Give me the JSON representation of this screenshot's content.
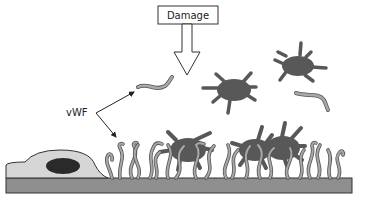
{
  "diagram": {
    "labels": {
      "damage": "Damage",
      "vwf": "vWF"
    },
    "colors": {
      "platelet": "#585858",
      "vwf_fiber": "#a8a8a8",
      "vwf_outline": "#555555",
      "endothelial_cell": "#d6d6d6",
      "nucleus": "#2a2a2a",
      "subendothelium": "#8f8f8f",
      "outline": "#333333"
    },
    "elements": [
      "damage-box",
      "damage-arrow",
      "vwf-label",
      "vwf-pointer-arrows",
      "free-vwf-strands",
      "free-platelets",
      "endothelial-cell",
      "subendothelium-layer",
      "bound-vwf-fibers",
      "adhered-platelets"
    ]
  }
}
